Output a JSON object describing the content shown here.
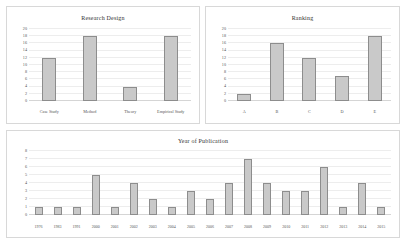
{
  "chart_data": [
    {
      "id": "research_design",
      "type": "bar",
      "title": "Research Design",
      "xlabel": "",
      "ylabel": "",
      "ylim": [
        0,
        20
      ],
      "yticks": [
        0,
        2,
        4,
        6,
        8,
        10,
        12,
        14,
        16,
        18,
        20
      ],
      "grid": true,
      "legend": "none",
      "categories": [
        "Case Study",
        "Method",
        "Theory",
        "Empirical Study"
      ],
      "values": [
        12,
        18,
        4,
        18
      ]
    },
    {
      "id": "ranking",
      "type": "bar",
      "title": "Ranking",
      "xlabel": "",
      "ylabel": "",
      "ylim": [
        0,
        20
      ],
      "yticks": [
        0,
        2,
        4,
        6,
        8,
        10,
        12,
        14,
        16,
        18,
        20
      ],
      "grid": true,
      "legend": "none",
      "categories": [
        "A",
        "B",
        "C",
        "D",
        "E"
      ],
      "values": [
        2,
        16,
        12,
        7,
        18
      ]
    },
    {
      "id": "year_of_publication",
      "type": "bar",
      "title": "Year of Publication",
      "xlabel": "",
      "ylabel": "",
      "ylim": [
        0,
        8
      ],
      "yticks": [
        0,
        1,
        2,
        3,
        4,
        5,
        6,
        7,
        8
      ],
      "grid": true,
      "legend": "none",
      "categories": [
        "1976",
        "1983",
        "1991",
        "2000",
        "2001",
        "2002",
        "2003",
        "2004",
        "2005",
        "2006",
        "2007",
        "2008",
        "2009",
        "2010",
        "2011",
        "2012",
        "2013",
        "2014",
        "2015"
      ],
      "values": [
        1,
        1,
        1,
        5,
        1,
        4,
        2,
        1,
        3,
        2,
        4,
        7,
        4,
        3,
        3,
        6,
        1,
        4,
        1
      ]
    }
  ],
  "style": {
    "bar_fill": "#c9c9c9",
    "bar_stroke": "#8d8d8d",
    "grid_color": "#ededed",
    "axis_color": "#d5d5d5",
    "background": "#ffffff",
    "text_color": "#555555"
  }
}
